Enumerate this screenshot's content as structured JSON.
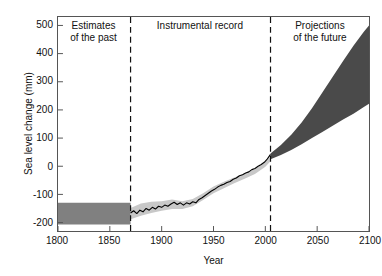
{
  "chart_data": {
    "type": "area",
    "title": "",
    "xlabel": "Year",
    "ylabel": "Sea level change (mm)",
    "xlim": [
      1800,
      2100
    ],
    "ylim": [
      -230,
      530
    ],
    "grid": false,
    "legend_position": "none",
    "xticks": [
      1800,
      1850,
      1900,
      1950,
      2000,
      2050,
      2100
    ],
    "yticks": [
      500,
      400,
      300,
      200,
      100,
      0,
      -100,
      -200
    ],
    "xtick_labels": [
      "1800",
      "1850",
      "1900",
      "1950",
      "2000",
      "2050",
      "2100"
    ],
    "ytick_labels": [
      "500",
      "400",
      "300",
      "200",
      "100",
      "0",
      "-100",
      "-200"
    ],
    "annotations": [
      {
        "name": "estimates-of-the-past",
        "text": "Estimates\nof the past",
        "x": 1835
      },
      {
        "name": "instrumental-record",
        "text": "Instrumental record",
        "x": 1937
      },
      {
        "name": "projections-of-the-future",
        "text": "Projections\nof the future",
        "x": 2052
      }
    ],
    "dividers": [
      {
        "name": "divider-1870",
        "x": 1870
      },
      {
        "name": "divider-2005",
        "x": 2005
      }
    ],
    "series": [
      {
        "name": "Estimates of the past (uncertainty band)",
        "type": "band",
        "color": "#808080",
        "x": [
          1800,
          1820,
          1840,
          1860,
          1870
        ],
        "upper": [
          -130,
          -130,
          -130,
          -130,
          -130
        ],
        "lower": [
          -207,
          -207,
          -207,
          -207,
          -207
        ]
      },
      {
        "name": "Instrumental record (uncertainty band)",
        "type": "band",
        "color": "#c8c8c8",
        "x": [
          1870,
          1880,
          1890,
          1900,
          1910,
          1920,
          1930,
          1940,
          1950,
          1960,
          1970,
          1980,
          1990,
          2000,
          2005
        ],
        "upper": [
          -148,
          -132,
          -126,
          -124,
          -118,
          -124,
          -116,
          -96,
          -72,
          -55,
          -40,
          -26,
          -10,
          16,
          34
        ],
        "lower": [
          -188,
          -176,
          -166,
          -158,
          -152,
          -152,
          -142,
          -120,
          -96,
          -78,
          -60,
          -44,
          -28,
          -2,
          18
        ]
      },
      {
        "name": "Instrumental record (measured sea level)",
        "type": "line",
        "color": "#000000",
        "x": [
          1870,
          1873,
          1876,
          1879,
          1882,
          1885,
          1888,
          1891,
          1894,
          1897,
          1900,
          1903,
          1906,
          1909,
          1912,
          1915,
          1918,
          1921,
          1924,
          1927,
          1930,
          1933,
          1936,
          1939,
          1942,
          1945,
          1948,
          1951,
          1954,
          1957,
          1960,
          1963,
          1966,
          1969,
          1972,
          1975,
          1978,
          1981,
          1984,
          1987,
          1990,
          1993,
          1996,
          1999,
          2002,
          2005
        ],
        "y": [
          -166,
          -158,
          -168,
          -156,
          -162,
          -150,
          -156,
          -146,
          -152,
          -142,
          -146,
          -138,
          -142,
          -134,
          -128,
          -136,
          -130,
          -138,
          -130,
          -134,
          -126,
          -130,
          -118,
          -112,
          -104,
          -96,
          -88,
          -82,
          -74,
          -68,
          -64,
          -58,
          -54,
          -46,
          -42,
          -34,
          -30,
          -24,
          -20,
          -12,
          -8,
          0,
          6,
          14,
          26,
          42
        ]
      },
      {
        "name": "Projections of the future (scenario range)",
        "type": "band",
        "color": "#4a4a4a",
        "x": [
          2005,
          2015,
          2025,
          2035,
          2045,
          2055,
          2065,
          2075,
          2085,
          2095,
          2100
        ],
        "upper": [
          45,
          75,
          112,
          155,
          206,
          262,
          318,
          374,
          428,
          478,
          500
        ],
        "lower": [
          25,
          40,
          58,
          78,
          100,
          122,
          144,
          166,
          186,
          210,
          222
        ]
      }
    ]
  }
}
